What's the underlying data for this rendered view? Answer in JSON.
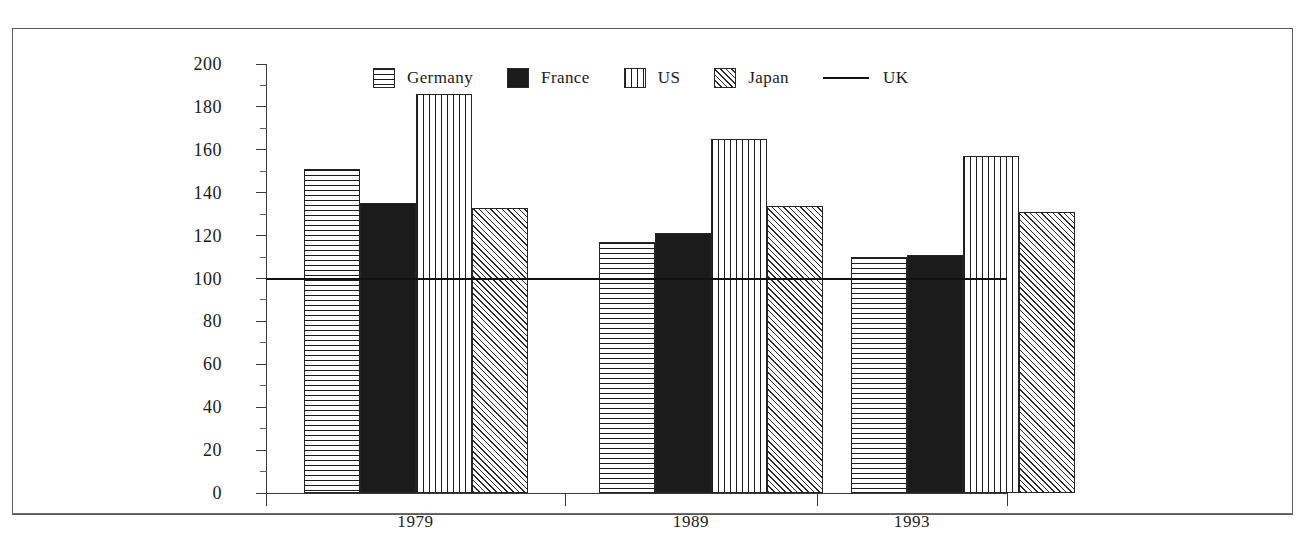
{
  "chart_data": {
    "type": "bar",
    "title": "",
    "subtitle": "",
    "xlabel": "",
    "ylabel": "",
    "categories": [
      "1979",
      "1989",
      "1993"
    ],
    "series": [
      {
        "name": "Germany",
        "pattern": "horizontal-lines",
        "values": [
          151,
          117,
          110
        ]
      },
      {
        "name": "France",
        "pattern": "solid-black",
        "values": [
          135,
          121,
          111
        ]
      },
      {
        "name": "US",
        "pattern": "vertical-lines",
        "values": [
          186,
          165,
          157
        ]
      },
      {
        "name": "Japan",
        "pattern": "diagonal-hatch",
        "values": [
          133,
          134,
          131
        ]
      }
    ],
    "reference_line": {
      "name": "UK",
      "value": 100,
      "style": "solid"
    },
    "ylim": [
      0,
      200
    ],
    "y_major_ticks": [
      0,
      20,
      40,
      60,
      80,
      100,
      120,
      140,
      160,
      180,
      200
    ],
    "y_minor_tick_step": 10,
    "y_tick_labels": [
      "0",
      "20",
      "40",
      "60",
      "80",
      "100",
      "120",
      "140",
      "160",
      "180",
      "200"
    ],
    "grid": false,
    "legend_position": "top-center"
  },
  "legend": {
    "entries": [
      {
        "label": "Germany",
        "swatch": "horizontal-lines"
      },
      {
        "label": "France",
        "swatch": "solid-black"
      },
      {
        "label": "US",
        "swatch": "vertical-lines"
      },
      {
        "label": "Japan",
        "swatch": "diagonal-hatch"
      },
      {
        "label": "UK",
        "swatch": "line"
      }
    ]
  },
  "axis": {
    "y_labels": [
      "200",
      "180",
      "160",
      "140",
      "120",
      "100",
      "80",
      "60",
      "40",
      "20",
      "0"
    ],
    "x_labels": [
      "1979",
      "1989",
      "1993"
    ]
  },
  "colors": {
    "ink": "#1b1b1b",
    "axis": "#3a3a3a",
    "frame": "#5a5a5a",
    "paper": "#ffffff"
  }
}
